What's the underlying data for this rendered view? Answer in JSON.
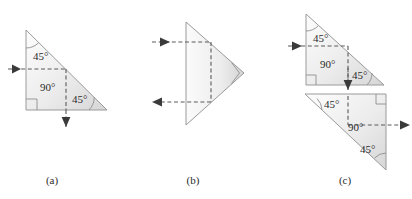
{
  "figure": {
    "background_color": "#ffffff",
    "outline_color": "#9a9a9a",
    "ray_color": "#5a5a5a",
    "arrow_color": "#3a3a3a",
    "text_color": "#2b2b2b",
    "fill_gradient_light": "#fdfdfd",
    "fill_gradient_dark": "#d9d9d9"
  },
  "panels": [
    {
      "id": "panel-a",
      "caption": "(a)",
      "caption_x": 52,
      "caption_y": 184,
      "prisms": [
        {
          "id": "prism-a",
          "points": "26,30 26,110 107,110",
          "angles": [
            {
              "value": "45°",
              "x": 33,
              "y": 60
            },
            {
              "value": "90°",
              "x": 40,
              "y": 91
            },
            {
              "value": "45°",
              "x": 72,
              "y": 103
            }
          ]
        }
      ],
      "rays": [
        {
          "id": "ray-a-in",
          "d": "M 8 69 L 66 69",
          "direction": "right"
        },
        {
          "id": "ray-a-internal",
          "d": "M 66 69 L 66 110",
          "direction": "none"
        },
        {
          "id": "ray-a-out",
          "d": "M 66 110 L 66 127",
          "direction": "down"
        }
      ]
    },
    {
      "id": "panel-b",
      "caption": "(b)",
      "caption_x": 193,
      "caption_y": 184,
      "prisms": [
        {
          "id": "prism-b",
          "points": "186,22 244,73 186,125",
          "angles": []
        }
      ],
      "rays": [
        {
          "id": "ray-b-in",
          "d": "M 152 42 L 211 42",
          "direction": "right"
        },
        {
          "id": "ray-b-internal",
          "d": "M 211 42 L 211 102",
          "direction": "none"
        },
        {
          "id": "ray-b-out",
          "d": "M 211 102 L 152 102",
          "direction": "left"
        }
      ]
    },
    {
      "id": "panel-c",
      "caption": "(c)",
      "caption_x": 345,
      "caption_y": 184,
      "prisms": [
        {
          "id": "prism-c-top",
          "points": "306,14 306,85 384,85",
          "angles": [
            {
              "value": "45°",
              "x": 313,
              "y": 42
            },
            {
              "value": "90°",
              "x": 320,
              "y": 68
            },
            {
              "value": "45°",
              "x": 352,
              "y": 79
            }
          ]
        },
        {
          "id": "prism-c-bottom",
          "points": "305,94 386,94 386,170",
          "angles": [
            {
              "value": "45°",
              "x": 324,
              "y": 108
            },
            {
              "value": "90°",
              "x": 348,
              "y": 131
            },
            {
              "value": "45°",
              "x": 360,
              "y": 153
            }
          ]
        }
      ],
      "rays": [
        {
          "id": "ray-c-in",
          "d": "M 288 46 L 348 46",
          "direction": "right"
        },
        {
          "id": "ray-c-top-internal",
          "d": "M 348 46 L 348 85",
          "direction": "none"
        },
        {
          "id": "ray-c-link",
          "d": "M 348 85 L 348 92",
          "direction": "down"
        },
        {
          "id": "ray-c-bottom-internal",
          "d": "M 348 96 L 348 125",
          "direction": "none"
        },
        {
          "id": "ray-c-out",
          "d": "M 348 125 L 410 125",
          "direction": "right"
        }
      ]
    }
  ]
}
